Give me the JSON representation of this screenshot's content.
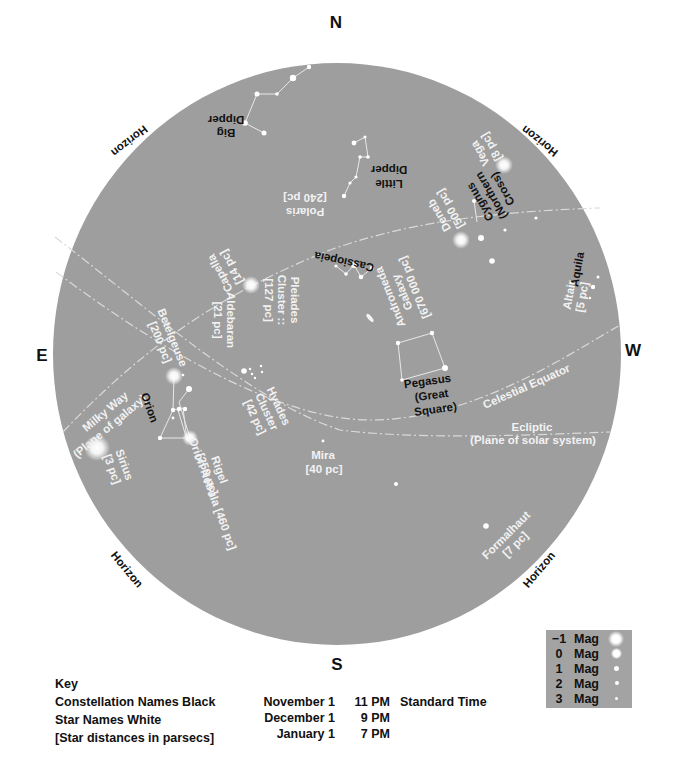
{
  "compass": {
    "north": "N",
    "south": "S",
    "east": "E",
    "west": "W"
  },
  "horizon_label": "Horizon",
  "constellations": {
    "big_dipper": [
      "Big",
      "Dipper"
    ],
    "little_dipper": [
      "Little",
      "Dipper"
    ],
    "cygnus": [
      "Cygnus",
      "(Northern",
      "Cross)"
    ],
    "cassiopeia": "Cassiopeia",
    "aquila": "Aquila",
    "orion": "Orion",
    "pegasus": [
      "Pegasus",
      "(Great",
      "Square)"
    ]
  },
  "stars": {
    "polaris": [
      "Polaris",
      "[240 pc]"
    ],
    "vega": [
      "Vega",
      "[8 pc]"
    ],
    "deneb": [
      "Deneb",
      "[500 pc]"
    ],
    "capella": [
      "Capella",
      "[14 pc]"
    ],
    "altair": [
      "Altair",
      "[5 pc]"
    ],
    "betelgeuse": [
      "Betelgeuse",
      "[200 pc]"
    ],
    "aldebaran": [
      "Aldebaran",
      "[21 pc]"
    ],
    "rigel": [
      "Rigel",
      "[250 pc]"
    ],
    "sirius": [
      "Sirius",
      "[3 pc]"
    ],
    "mira": [
      "Mira",
      "[40 pc]"
    ],
    "formalhaut": [
      "Formalhaut",
      "[7 pc]"
    ]
  },
  "objects": {
    "andromeda": [
      "Andromeda",
      "Galaxy",
      "[670 000 pc]"
    ],
    "pleiades": [
      "Pleiades",
      "Cluster ::",
      "[127 pc]"
    ],
    "hyades": [
      "Hyades",
      "Cluster",
      "[42 pc]"
    ],
    "orion_nebula": "Orion Nebula [460 pc]"
  },
  "lines": {
    "milky_way": [
      "Milky Way",
      "(Plane of galaxy)"
    ],
    "celestial_equator": "Celestial Equator",
    "ecliptic": [
      "Ecliptic",
      "(Plane of solar system)"
    ]
  },
  "key": {
    "title": "Key",
    "items": [
      "Constellation Names Black",
      "Star Names White",
      "[Star distances in parsecs]"
    ]
  },
  "times": [
    {
      "date": "November 1",
      "time": "11 PM",
      "note": "Standard Time"
    },
    {
      "date": "December 1",
      "time": "9 PM",
      "note": ""
    },
    {
      "date": "January 1",
      "time": "7 PM",
      "note": ""
    }
  ],
  "magnitude_legend": [
    {
      "value": "−1",
      "unit": "Mag"
    },
    {
      "value": "0",
      "unit": "Mag"
    },
    {
      "value": "1",
      "unit": "Mag"
    },
    {
      "value": "2",
      "unit": "Mag"
    },
    {
      "value": "3",
      "unit": "Mag"
    }
  ],
  "colors": {
    "sky": "#9e9e9e",
    "star": "#ffffff",
    "line": "#dcdcdc",
    "constellation_text": "#111111",
    "star_text": "#f2f2f2"
  }
}
